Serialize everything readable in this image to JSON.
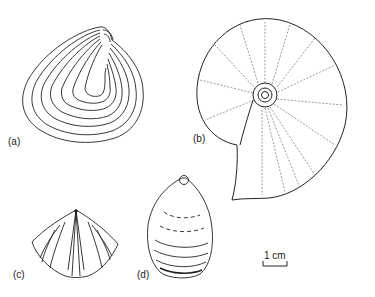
{
  "figure": {
    "panels": [
      {
        "id": "a",
        "label": "(a)",
        "subject": "bivalve-shell"
      },
      {
        "id": "b",
        "label": "(b)",
        "subject": "ammonoid-coiled-shell"
      },
      {
        "id": "c",
        "label": "(c)",
        "subject": "brachiopod-ribbed-shell"
      },
      {
        "id": "d",
        "label": "(d)",
        "subject": "brachiopod-oval-shell"
      }
    ],
    "scale_bar": {
      "label": "1 cm"
    }
  }
}
